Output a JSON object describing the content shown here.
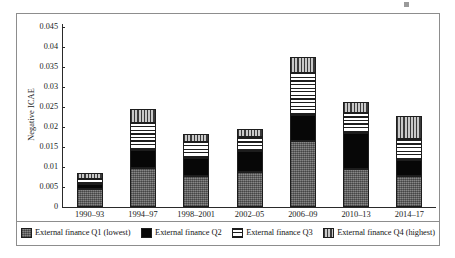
{
  "chart_data": {
    "type": "bar",
    "stacked": true,
    "title": "",
    "xlabel": "",
    "ylabel": "Negative ICAE",
    "ylim": [
      0,
      0.045
    ],
    "yticks": [
      0,
      0.005,
      0.01,
      0.015,
      0.02,
      0.025,
      0.03,
      0.035,
      0.04,
      0.045
    ],
    "ytick_labels": [
      "0",
      "0.005",
      "0.01",
      "0.015",
      "0.02",
      "0.025",
      "0.03",
      "0.035",
      "0.04",
      "0.045"
    ],
    "grid": false,
    "legend_position": "bottom",
    "categories": [
      "1990–93",
      "1994–97",
      "1998–2001",
      "2002–05",
      "2006–09",
      "2010–13",
      "2014–17"
    ],
    "series": [
      {
        "name": "External finance Q1 (lowest)",
        "pattern": "cross-hatch-gray",
        "values": [
          0.0045,
          0.0098,
          0.0077,
          0.0087,
          0.0165,
          0.0095,
          0.0078
        ]
      },
      {
        "name": "External finance Q2",
        "pattern": "solid-black",
        "values": [
          0.0012,
          0.0045,
          0.0046,
          0.0053,
          0.0065,
          0.009,
          0.004
        ]
      },
      {
        "name": "External finance Q3",
        "pattern": "horizontal-lines",
        "values": [
          0.0013,
          0.0066,
          0.004,
          0.0035,
          0.0105,
          0.005,
          0.0052
        ]
      },
      {
        "name": "External finance Q4 (highest)",
        "pattern": "vertical-lines",
        "values": [
          0.0015,
          0.0036,
          0.002,
          0.002,
          0.004,
          0.0028,
          0.0058
        ]
      }
    ],
    "totals": [
      0.0085,
      0.0245,
      0.0183,
      0.0195,
      0.0375,
      0.0283,
      0.0228
    ]
  },
  "legend": {
    "items": [
      {
        "label": "External finance Q1 (lowest)",
        "swatch": "q1"
      },
      {
        "label": "External finance Q2",
        "swatch": "q2"
      },
      {
        "label": "External finance Q3",
        "swatch": "q3"
      },
      {
        "label": "External finance Q4 (highest)",
        "swatch": "q4"
      }
    ]
  },
  "colors": {
    "q1": "#6e6e6e",
    "q2": "#070707",
    "q3": "#ffffff",
    "q4": "#8a8a8a",
    "outline": "#1d1d1d",
    "frame": "#8d8d8d",
    "axis": "#2a2a2a",
    "text": "#1a1a1a"
  }
}
